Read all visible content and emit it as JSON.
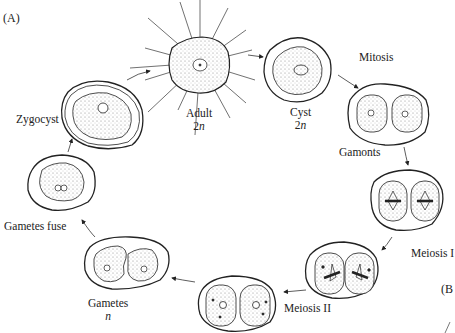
{
  "panel_labels": {
    "a": "(A)",
    "b": "(B"
  },
  "stages": {
    "adult": {
      "name": "Adult",
      "ploidy_num": "2",
      "ploidy_var": "n"
    },
    "cyst": {
      "name": "Cyst",
      "ploidy_num": "2",
      "ploidy_var": "n"
    },
    "mitosis": {
      "name": "Mitosis"
    },
    "gamonts": {
      "name": "Gamonts"
    },
    "meiosis1": {
      "name": "Meiosis I"
    },
    "meiosis2": {
      "name": "Meiosis II"
    },
    "gametes": {
      "name": "Gametes",
      "ploidy_var": "n"
    },
    "gametes_fuse": {
      "name": "Gametes fuse"
    },
    "zygocyst": {
      "name": "Zygocyst"
    }
  },
  "colors": {
    "stroke": "#222222",
    "stipple": "#cfcfcf",
    "background": "#ffffff"
  }
}
